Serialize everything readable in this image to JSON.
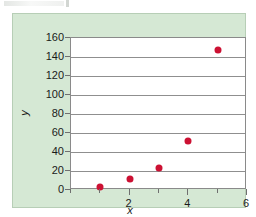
{
  "figure": {
    "panel_color": "#d5e8d4",
    "plot_background": "#ffffff",
    "marker_color": "#cc1133",
    "gridline_color": "#8f8f8f",
    "axis_color": "#8a8a8a"
  },
  "chart_data": {
    "type": "scatter",
    "title": "",
    "xlabel": "x",
    "ylabel": "y",
    "xlim": [
      0,
      6
    ],
    "ylim": [
      0,
      160
    ],
    "grid": true,
    "grid_axis": "y",
    "legend": false,
    "x_ticks": [
      0,
      1,
      2,
      3,
      4,
      5,
      6
    ],
    "x_tick_labels": [
      "",
      "",
      "2",
      "",
      "4",
      "",
      "6"
    ],
    "y_ticks": [
      0,
      20,
      40,
      60,
      80,
      100,
      120,
      140,
      160
    ],
    "y_tick_labels": [
      "0",
      "20",
      "40",
      "60",
      "80",
      "100",
      "120",
      "140",
      "160"
    ],
    "series": [
      {
        "name": "data",
        "marker": "circle",
        "color": "#cc1133",
        "points": [
          {
            "x": 1,
            "y": 3
          },
          {
            "x": 2,
            "y": 12
          },
          {
            "x": 3,
            "y": 23
          },
          {
            "x": 4,
            "y": 52
          },
          {
            "x": 5,
            "y": 147
          }
        ]
      }
    ]
  }
}
